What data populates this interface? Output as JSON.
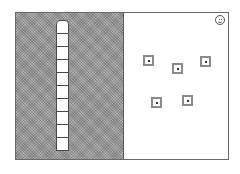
{
  "game": {
    "left_panel": {
      "pattern": "checkered-gray",
      "column": {
        "cell_count": 10
      }
    },
    "right_panel": {
      "status_icon": "smiley-icon",
      "targets": [
        {
          "id": 1,
          "x": 127,
          "y": 42
        },
        {
          "id": 2,
          "x": 156,
          "y": 50
        },
        {
          "id": 3,
          "x": 184,
          "y": 43
        },
        {
          "id": 4,
          "x": 135,
          "y": 84
        },
        {
          "id": 5,
          "x": 166,
          "y": 82
        }
      ]
    },
    "colors": {
      "frame": "#6a6a6a",
      "panel_gray": "#9a9a9a",
      "target_ring": "#8a8a8a",
      "target_dot": "#333333",
      "background": "#ffffff"
    }
  }
}
